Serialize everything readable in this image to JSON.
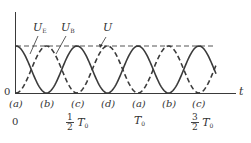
{
  "diagram": {
    "type": "energy-oscillation",
    "axis": {
      "x_label": "t",
      "origin_label": "0"
    },
    "curves": [
      {
        "name": "U_E",
        "label_main": "U",
        "label_sub": "E",
        "style": "dashed",
        "shape": "sin^2"
      },
      {
        "name": "U_B",
        "label_main": "U",
        "label_sub": "B",
        "style": "solid",
        "shape": "cos^2"
      },
      {
        "name": "U",
        "label_main": "U",
        "label_sub": "",
        "style": "dashed-horizontal",
        "shape": "constant"
      }
    ],
    "point_labels": [
      "(a)",
      "(b)",
      "(c)",
      "(d)",
      "(a)",
      "(b)",
      "(c)"
    ],
    "time_labels": {
      "t0": "0",
      "t1_num": "1",
      "t1_den": "2",
      "t1_unit": "T",
      "t1_sub": "0",
      "t2_unit": "T",
      "t2_sub": "0",
      "t3_num": "3",
      "t3_den": "2",
      "t3_unit": "T",
      "t3_sub": "0"
    },
    "colors": {
      "stroke": "#3a3a3a",
      "text": "#333333",
      "background": "#ffffff"
    }
  }
}
